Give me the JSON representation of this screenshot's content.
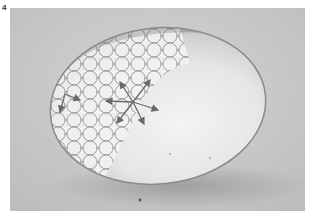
{
  "figure": {
    "label": "4",
    "colors": {
      "background": "#c9c9c9",
      "droplet_highlight": "#f0f0f0",
      "shadow": "#9a9a9a",
      "diagram_lines": "#6e6e6e",
      "arrows": "#6a6a6a"
    }
  }
}
